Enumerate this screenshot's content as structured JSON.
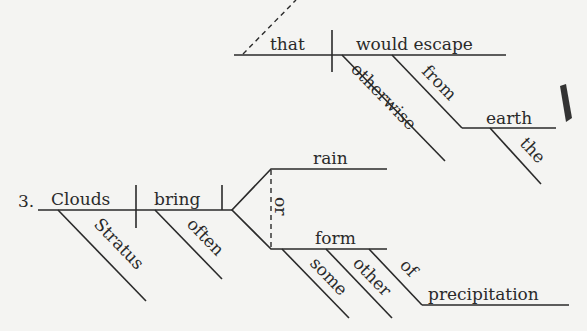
{
  "diagram": {
    "type": "sentence-diagram",
    "fragment_top": {
      "subject": "that",
      "verb": "would escape",
      "modifiers": [
        "otherwise",
        "from",
        "earth",
        "the"
      ]
    },
    "item_number": "3.",
    "sentence_3": {
      "subject": "Clouds",
      "subject_modifier": "Stratus",
      "verb": "bring",
      "verb_modifier": "often",
      "conjunction": "or",
      "objects": [
        "rain",
        "form"
      ],
      "form_modifiers": [
        "some",
        "other",
        "of"
      ],
      "prepositional_object": "precipitation"
    }
  },
  "colors": {
    "ink": "#2a2a2a",
    "paper": "#f4f4f2"
  }
}
